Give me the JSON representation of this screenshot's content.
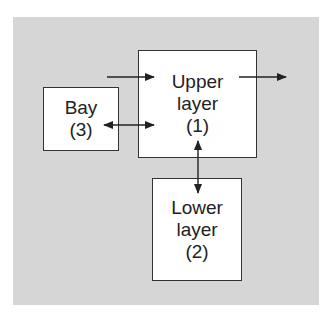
{
  "diagram": {
    "background_color": "#d6d6d6",
    "box_fill": "#ffffff",
    "line_color": "#222222",
    "nodes": [
      {
        "id": "upper",
        "lines": [
          "Upper",
          "layer",
          "(1)"
        ]
      },
      {
        "id": "bay",
        "lines": [
          "Bay",
          "(3)"
        ]
      },
      {
        "id": "lower",
        "lines": [
          "Lower",
          "layer",
          "(2)"
        ]
      }
    ],
    "edges": [
      {
        "from": "external",
        "to": "upper",
        "type": "inflow"
      },
      {
        "from": "upper",
        "to": "external",
        "type": "outflow"
      },
      {
        "from": "bay",
        "to": "upper",
        "type": "bidirectional"
      },
      {
        "from": "upper",
        "to": "lower",
        "type": "bidirectional"
      }
    ]
  }
}
